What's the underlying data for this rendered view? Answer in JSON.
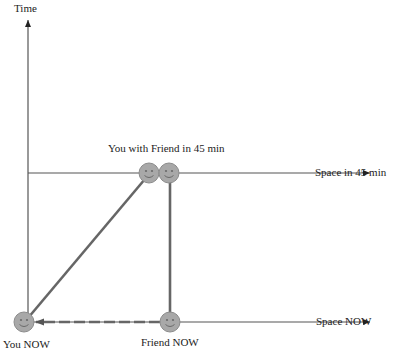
{
  "labels": {
    "time_axis": "Time",
    "space_45": "Space in 45 min",
    "space_now": "Space NOW",
    "meeting": "You with Friend in 45 min",
    "you_now": "You NOW",
    "friend_now": "Friend NOW"
  },
  "colors": {
    "axis": "#555555",
    "path": "#666666",
    "smiley_fill": "#a8a8a8",
    "smiley_stroke": "#888888",
    "text": "#222222"
  }
}
